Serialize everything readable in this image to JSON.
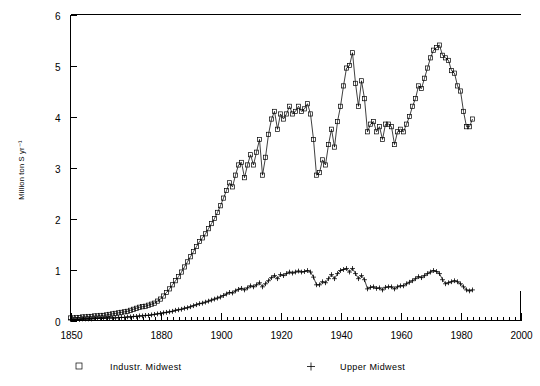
{
  "chart_data": {
    "type": "line",
    "title": "",
    "xlabel": "",
    "ylabel": "Million ton S yr⁻¹",
    "xlim": [
      1850,
      2000
    ],
    "ylim": [
      0,
      6
    ],
    "x_major_ticks": [
      1850,
      1880,
      1900,
      1920,
      1940,
      1960,
      1980,
      2000
    ],
    "x_tick_labels": [
      "1850",
      "1880",
      "1900",
      "1920",
      "1940",
      "1960",
      "1980",
      "2000"
    ],
    "x_minor_tick_step": 2,
    "y_major_ticks": [
      0,
      1,
      2,
      3,
      4,
      5,
      6
    ],
    "y_tick_labels": [
      "0",
      "1",
      "2",
      "3",
      "4",
      "5",
      "6"
    ],
    "grid": false,
    "legend_position": "below-plot",
    "legend": [
      {
        "label": "Industr. Midwest",
        "marker": "square"
      },
      {
        "label": "Upper Midwest",
        "marker": "plus"
      }
    ],
    "x": [
      1850,
      1851,
      1852,
      1853,
      1854,
      1855,
      1856,
      1857,
      1858,
      1859,
      1860,
      1861,
      1862,
      1863,
      1864,
      1865,
      1866,
      1867,
      1868,
      1869,
      1870,
      1871,
      1872,
      1873,
      1874,
      1875,
      1876,
      1877,
      1878,
      1879,
      1880,
      1881,
      1882,
      1883,
      1884,
      1885,
      1886,
      1887,
      1888,
      1889,
      1890,
      1891,
      1892,
      1893,
      1894,
      1895,
      1896,
      1897,
      1898,
      1899,
      1900,
      1901,
      1902,
      1903,
      1904,
      1905,
      1906,
      1907,
      1908,
      1909,
      1910,
      1911,
      1912,
      1913,
      1914,
      1915,
      1916,
      1917,
      1918,
      1919,
      1920,
      1921,
      1922,
      1923,
      1924,
      1925,
      1926,
      1927,
      1928,
      1929,
      1930,
      1931,
      1932,
      1933,
      1934,
      1935,
      1936,
      1937,
      1938,
      1939,
      1940,
      1941,
      1942,
      1943,
      1944,
      1945,
      1946,
      1947,
      1948,
      1949,
      1950,
      1951,
      1952,
      1953,
      1954,
      1955,
      1956,
      1957,
      1958,
      1959,
      1960,
      1961,
      1962,
      1963,
      1964,
      1965,
      1966,
      1967,
      1968,
      1969,
      1970,
      1971,
      1972,
      1973,
      1974,
      1975,
      1976,
      1977,
      1978,
      1979,
      1980,
      1981,
      1982,
      1983,
      1984
    ],
    "series": [
      {
        "name": "Industr. Midwest",
        "marker": "square",
        "values": [
          0.05,
          0.05,
          0.06,
          0.06,
          0.07,
          0.07,
          0.08,
          0.08,
          0.09,
          0.09,
          0.1,
          0.1,
          0.11,
          0.12,
          0.13,
          0.14,
          0.15,
          0.16,
          0.17,
          0.18,
          0.2,
          0.22,
          0.24,
          0.26,
          0.27,
          0.28,
          0.3,
          0.32,
          0.34,
          0.38,
          0.42,
          0.48,
          0.55,
          0.62,
          0.7,
          0.78,
          0.86,
          0.95,
          1.05,
          1.15,
          1.25,
          1.35,
          1.45,
          1.55,
          1.62,
          1.7,
          1.8,
          1.9,
          2.0,
          2.12,
          2.25,
          2.4,
          2.55,
          2.7,
          2.62,
          2.85,
          3.05,
          3.1,
          2.8,
          3.05,
          3.25,
          3.05,
          3.3,
          3.55,
          2.85,
          3.2,
          3.65,
          3.95,
          4.1,
          3.75,
          4.05,
          3.95,
          4.05,
          4.2,
          4.05,
          4.1,
          4.2,
          4.1,
          4.15,
          4.25,
          4.05,
          3.55,
          2.85,
          2.9,
          3.15,
          3.05,
          3.45,
          3.75,
          3.4,
          3.9,
          4.2,
          4.6,
          4.95,
          5.0,
          5.25,
          4.65,
          4.2,
          4.7,
          4.35,
          3.7,
          3.85,
          3.9,
          3.7,
          3.8,
          3.55,
          3.85,
          3.85,
          3.8,
          3.45,
          3.7,
          3.75,
          3.7,
          3.85,
          4.0,
          4.2,
          4.35,
          4.6,
          4.55,
          4.75,
          4.95,
          5.15,
          5.3,
          5.35,
          5.4,
          5.2,
          5.15,
          5.1,
          4.9,
          4.85,
          4.6,
          4.5,
          4.1,
          3.8,
          3.8,
          3.95
        ]
      },
      {
        "name": "Upper Midwest",
        "marker": "plus",
        "values": [
          0.02,
          0.02,
          0.02,
          0.02,
          0.03,
          0.03,
          0.03,
          0.03,
          0.04,
          0.04,
          0.04,
          0.04,
          0.05,
          0.05,
          0.05,
          0.05,
          0.06,
          0.06,
          0.06,
          0.07,
          0.07,
          0.08,
          0.08,
          0.09,
          0.09,
          0.1,
          0.1,
          0.11,
          0.12,
          0.13,
          0.14,
          0.15,
          0.16,
          0.17,
          0.18,
          0.2,
          0.21,
          0.22,
          0.24,
          0.25,
          0.27,
          0.29,
          0.31,
          0.33,
          0.34,
          0.36,
          0.38,
          0.4,
          0.42,
          0.44,
          0.46,
          0.49,
          0.52,
          0.55,
          0.54,
          0.58,
          0.61,
          0.63,
          0.6,
          0.64,
          0.68,
          0.66,
          0.7,
          0.74,
          0.66,
          0.72,
          0.78,
          0.84,
          0.88,
          0.82,
          0.9,
          0.88,
          0.92,
          0.95,
          0.93,
          0.95,
          0.97,
          0.95,
          0.96,
          0.98,
          0.95,
          0.85,
          0.7,
          0.7,
          0.76,
          0.74,
          0.82,
          0.9,
          0.82,
          0.92,
          0.98,
          1.0,
          1.02,
          0.95,
          1.02,
          0.92,
          0.82,
          0.88,
          0.8,
          0.62,
          0.65,
          0.66,
          0.63,
          0.64,
          0.6,
          0.65,
          0.66,
          0.66,
          0.62,
          0.66,
          0.68,
          0.68,
          0.72,
          0.75,
          0.78,
          0.82,
          0.86,
          0.84,
          0.88,
          0.92,
          0.95,
          0.98,
          0.96,
          0.92,
          0.8,
          0.72,
          0.74,
          0.76,
          0.78,
          0.76,
          0.72,
          0.66,
          0.6,
          0.58,
          0.6
        ]
      }
    ]
  },
  "axes": {
    "ylabel": "Million ton S yr⁻¹"
  },
  "legend": {
    "item0_label": "Industr. Midwest",
    "item1_label": "Upper Midwest"
  },
  "ticks": {
    "x": [
      "1850",
      "1880",
      "1900",
      "1920",
      "1940",
      "1960",
      "1980",
      "2000"
    ],
    "y": [
      "0",
      "1",
      "2",
      "3",
      "4",
      "5",
      "6"
    ]
  },
  "colors": {
    "foreground": "#000000",
    "background": "#ffffff"
  }
}
